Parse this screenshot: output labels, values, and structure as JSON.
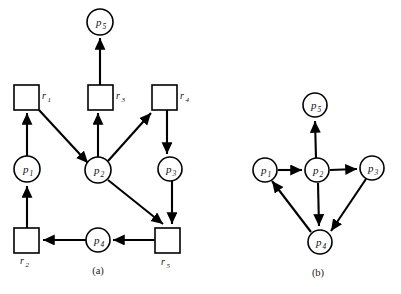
{
  "figure": {
    "background_color": "#ffffff",
    "line_color": "#000000",
    "panels": [
      {
        "id": "panel-a",
        "caption": "(a)",
        "caption_x": 98,
        "caption_y": 272,
        "type": "resource-allocation-graph",
        "nodes": [
          {
            "id": "p5",
            "label": "p",
            "sub": "5",
            "shape": "circle",
            "cx": 100,
            "cy": 22,
            "r": 13
          },
          {
            "id": "r1",
            "label": "r",
            "sub": "1",
            "shape": "square",
            "x": 14,
            "y": 85,
            "w": 25,
            "h": 25,
            "label_x": 42,
            "label_y": 99
          },
          {
            "id": "r3",
            "label": "r",
            "sub": "3",
            "shape": "square",
            "x": 88,
            "y": 85,
            "w": 25,
            "h": 25,
            "label_x": 116,
            "label_y": 99
          },
          {
            "id": "r4",
            "label": "r",
            "sub": "4",
            "shape": "square",
            "x": 152,
            "y": 85,
            "w": 25,
            "h": 25,
            "label_x": 180,
            "label_y": 99
          },
          {
            "id": "p1",
            "label": "p",
            "sub": "1",
            "shape": "circle",
            "cx": 27,
            "cy": 169,
            "r": 13
          },
          {
            "id": "p2",
            "label": "p",
            "sub": "2",
            "shape": "circle",
            "cx": 98,
            "cy": 170,
            "r": 13
          },
          {
            "id": "p3",
            "label": "p",
            "sub": "3",
            "shape": "circle",
            "cx": 170,
            "cy": 169,
            "r": 12
          },
          {
            "id": "r2",
            "label": "r",
            "sub": "2",
            "shape": "square",
            "x": 14,
            "y": 228,
            "w": 25,
            "h": 25,
            "label_x": 20,
            "label_y": 264
          },
          {
            "id": "p4",
            "label": "p",
            "sub": "4",
            "shape": "circle",
            "cx": 98,
            "cy": 240,
            "r": 12
          },
          {
            "id": "r5",
            "label": "r",
            "sub": "5",
            "shape": "square",
            "x": 155,
            "y": 228,
            "w": 25,
            "h": 25,
            "label_x": 161,
            "label_y": 265
          }
        ],
        "edges": [
          {
            "from": "r3",
            "to": "p5",
            "kind": "assignment"
          },
          {
            "from": "p1",
            "to": "r1",
            "kind": "request"
          },
          {
            "from": "r1",
            "to": "p2",
            "kind": "assignment"
          },
          {
            "from": "p2",
            "to": "r3",
            "kind": "request"
          },
          {
            "from": "p2",
            "to": "r4",
            "kind": "request"
          },
          {
            "from": "r4",
            "to": "p3",
            "kind": "assignment"
          },
          {
            "from": "p2",
            "to": "r5",
            "kind": "request"
          },
          {
            "from": "p3",
            "to": "r5",
            "kind": "request"
          },
          {
            "from": "r5",
            "to": "p4",
            "kind": "assignment"
          },
          {
            "from": "p4",
            "to": "r2",
            "kind": "assignment"
          },
          {
            "from": "r2",
            "to": "p1",
            "kind": "assignment"
          }
        ]
      },
      {
        "id": "panel-b",
        "caption": "(b)",
        "caption_x": 318,
        "caption_y": 274,
        "type": "wait-for-graph",
        "nodes": [
          {
            "id": "p5",
            "label": "p",
            "sub": "5",
            "shape": "circle",
            "cx": 315,
            "cy": 105,
            "r": 12
          },
          {
            "id": "p1",
            "label": "p",
            "sub": "1",
            "shape": "circle",
            "cx": 265,
            "cy": 170,
            "r": 12
          },
          {
            "id": "p2",
            "label": "p",
            "sub": "2",
            "shape": "circle",
            "cx": 317,
            "cy": 170,
            "r": 12
          },
          {
            "id": "p3",
            "label": "p",
            "sub": "3",
            "shape": "circle",
            "cx": 372,
            "cy": 168,
            "r": 12
          },
          {
            "id": "p4",
            "label": "p",
            "sub": "4",
            "shape": "circle",
            "cx": 320,
            "cy": 242,
            "r": 12
          }
        ],
        "edges": [
          {
            "from": "p2",
            "to": "p5",
            "kind": "wait-for"
          },
          {
            "from": "p1",
            "to": "p2",
            "kind": "wait-for"
          },
          {
            "from": "p2",
            "to": "p3",
            "kind": "wait-for"
          },
          {
            "from": "p2",
            "to": "p4",
            "kind": "wait-for"
          },
          {
            "from": "p3",
            "to": "p4",
            "kind": "wait-for"
          },
          {
            "from": "p4",
            "to": "p1",
            "kind": "wait-for"
          }
        ]
      }
    ],
    "bottom_text": ""
  }
}
